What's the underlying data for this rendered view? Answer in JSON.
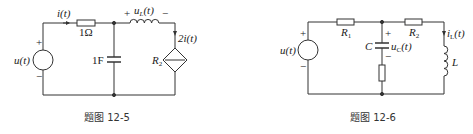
{
  "figures": [
    {
      "caption": "题图 12-5",
      "labels": {
        "source": "u(t)",
        "current": "i(t)",
        "resistor": "1Ω",
        "inductor_voltage": "u",
        "inductor_voltage_sub": "L",
        "inductor_voltage_tail": "(t)",
        "capacitor": "1F",
        "dep_source_value": "2i(t)",
        "dep_source_name": "R",
        "dep_source_sub": "2",
        "plus": "+",
        "minus": "−"
      }
    },
    {
      "caption": "题图 12-6",
      "labels": {
        "source": "u(t)",
        "r1": "R",
        "r1_sub": "1",
        "r2": "R",
        "r2_sub": "2",
        "capacitor": "C",
        "cap_voltage": "u",
        "cap_voltage_sub": "C",
        "cap_voltage_tail": "(t)",
        "inductor_current": "i",
        "inductor_current_sub": "L",
        "inductor_current_tail": "(t)",
        "inductor": "L",
        "plus": "+",
        "minus": "−"
      }
    }
  ]
}
